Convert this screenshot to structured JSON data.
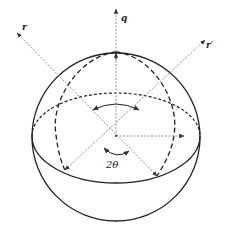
{
  "diagram": {
    "type": "sphere-geometry",
    "labels": {
      "r": "r",
      "r_prime": "r′",
      "q": "q",
      "angle": "2θ"
    },
    "colors": {
      "outline": "#222222",
      "dashed": "#222222",
      "vector": "#888888",
      "background": "#ffffff"
    },
    "geometry": {
      "center": [
        116,
        136
      ],
      "sphere_radius": 84,
      "vectors": [
        {
          "name": "r",
          "from": [
            157,
            176
          ],
          "to": [
            17,
            33
          ]
        },
        {
          "name": "r_prime",
          "from": [
            65,
            170
          ],
          "to": [
            205,
            40
          ]
        },
        {
          "name": "q",
          "from": [
            116,
            136
          ],
          "to": [
            116,
            8
          ]
        },
        {
          "name": "horizontal",
          "from": [
            116,
            136
          ],
          "to": [
            184,
            136
          ]
        }
      ]
    }
  }
}
